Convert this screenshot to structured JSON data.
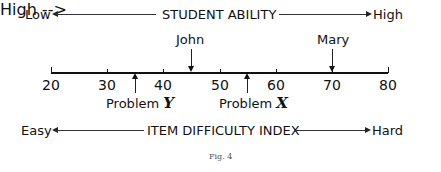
{
  "top_scale": {
    "left_label": "Low",
    "title": "STUDENT ABILITY",
    "right_label": "High"
  },
  "bottom_scale": {
    "left_label": "Easy",
    "title": "ITEM DIFFICULTY INDEX",
    "right_label": "Hard"
  },
  "axis": {
    "min": 20,
    "max": 80,
    "ticks": [
      "20",
      "30",
      "40",
      "50",
      "60",
      "70",
      "80"
    ]
  },
  "students": [
    {
      "name": "John",
      "value": 45
    },
    {
      "name": "Mary",
      "value": 65
    }
  ],
  "problems": [
    {
      "prefix": "Problem",
      "letter": "Y",
      "value": 35
    },
    {
      "prefix": "Problem",
      "letter": "X",
      "value": 55
    }
  ],
  "caption": "Fig. 4"
}
